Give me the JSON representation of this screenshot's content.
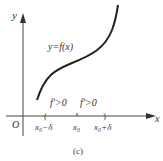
{
  "axes": {
    "x_label": "x",
    "y_label": "y",
    "origin_label": "O"
  },
  "curve": {
    "label": "y=f(x)",
    "color": "#222222"
  },
  "annotations": {
    "left_derivative": "f'>0",
    "right_derivative": "f'>0"
  },
  "ticks": {
    "left": "x₀−δ",
    "center": "x₀",
    "right": "x₀+δ"
  },
  "caption": "(c)"
}
